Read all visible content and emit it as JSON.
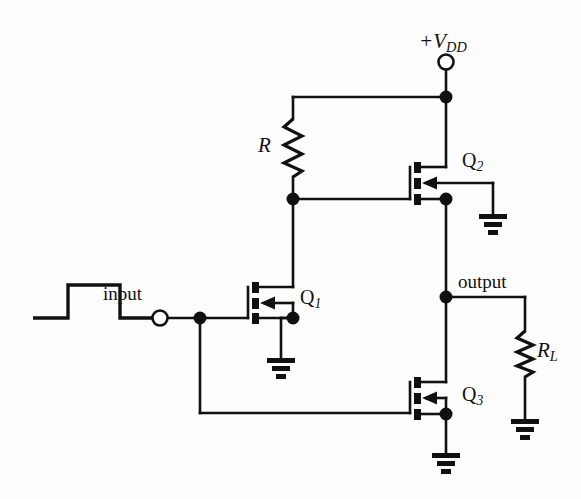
{
  "figure": {
    "type": "schematic",
    "background_color": "#fdfdfd",
    "line_color": "#111111"
  },
  "labels": {
    "supply": {
      "prefix": "+V",
      "sub": "DD"
    },
    "resistor_r": {
      "text": "R"
    },
    "resistor_rl": {
      "prefix": "R",
      "sub": "L"
    },
    "q1": {
      "prefix": "Q",
      "sub": "1"
    },
    "q2": {
      "prefix": "Q",
      "sub": "2"
    },
    "q3": {
      "prefix": "Q",
      "sub": "3"
    },
    "input": {
      "text": "input"
    },
    "output": {
      "text": "output"
    }
  },
  "components": [
    {
      "name": "supply-terminal",
      "kind": "open-terminal",
      "label": "+VDD",
      "x": 446,
      "y": 61
    },
    {
      "name": "resistor-r",
      "kind": "resistor",
      "label": "R",
      "orientation": "vertical",
      "x": 293,
      "y_top": 118,
      "y_bottom": 178
    },
    {
      "name": "transistor-q2",
      "kind": "mosfet",
      "label": "Q2",
      "x": 410,
      "y": 183
    },
    {
      "name": "transistor-q1",
      "kind": "mosfet",
      "label": "Q1",
      "x": 248,
      "y": 303
    },
    {
      "name": "transistor-q3",
      "kind": "mosfet",
      "label": "Q3",
      "x": 410,
      "y": 398
    },
    {
      "name": "resistor-rl",
      "kind": "resistor",
      "label": "RL",
      "orientation": "vertical",
      "x": 525,
      "y_top": 330,
      "y_bottom": 378
    },
    {
      "name": "input-terminal",
      "kind": "open-terminal",
      "label": "input",
      "x": 160,
      "y": 318
    },
    {
      "name": "input-waveform",
      "kind": "pulse-waveform",
      "x": 35,
      "y": 285
    },
    {
      "name": "ground-q2",
      "kind": "ground",
      "x": 493,
      "y": 213
    },
    {
      "name": "ground-q1",
      "kind": "ground",
      "x": 281,
      "y": 357
    },
    {
      "name": "ground-q3",
      "kind": "ground",
      "x": 446,
      "y": 452
    },
    {
      "name": "ground-rl",
      "kind": "ground",
      "x": 525,
      "y": 418
    }
  ],
  "nodes": [
    {
      "name": "junction-vdd",
      "x": 446,
      "y": 97
    },
    {
      "name": "junction-r-bottom",
      "x": 293,
      "y": 199
    },
    {
      "name": "junction-q2-source",
      "x": 446,
      "y": 199
    },
    {
      "name": "junction-output",
      "x": 446,
      "y": 297
    },
    {
      "name": "junction-q1-source",
      "x": 293,
      "y": 318
    },
    {
      "name": "junction-input",
      "x": 200,
      "y": 318
    },
    {
      "name": "junction-q3-source",
      "x": 446,
      "y": 414
    }
  ]
}
